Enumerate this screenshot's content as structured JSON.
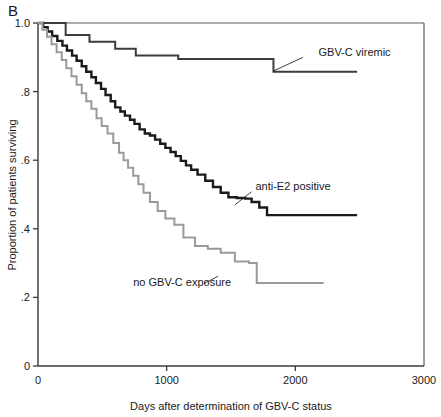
{
  "figure": {
    "panel_label": "B"
  },
  "chart_data": {
    "type": "line",
    "title": "",
    "subtitle": "",
    "xlabel": "Days after determination of GBV-C status",
    "ylabel": "Proportion of patients surviving",
    "xlim": [
      0,
      3000
    ],
    "ylim": [
      0,
      1.0
    ],
    "xticks": [
      0,
      1000,
      2000,
      3000
    ],
    "xticklabels": [
      "0",
      "1000",
      "2000",
      "3000"
    ],
    "yticks": [
      0,
      0.2,
      0.4,
      0.6,
      0.8,
      1.0
    ],
    "yticklabels": [
      "0",
      ".2",
      ".4",
      ".6",
      ".8",
      "1.0"
    ],
    "grid": false,
    "legend_position": "inline-annotations",
    "curve_style": "step-post (Kaplan-Meier)",
    "series": [
      {
        "name": "GBV-C viremic",
        "color": "#3d3d3d",
        "stroke_width": 2.0,
        "label_x": 2180,
        "label_y": 0.915,
        "leader": [
          [
            2060,
            0.9
          ],
          [
            1830,
            0.86
          ]
        ],
        "x": [
          0,
          215,
          215,
          400,
          400,
          600,
          600,
          760,
          760,
          1090,
          1090,
          1830,
          1830,
          2480
        ],
        "y": [
          1.0,
          1.0,
          0.965,
          0.965,
          0.945,
          0.945,
          0.925,
          0.925,
          0.905,
          0.905,
          0.895,
          0.895,
          0.858,
          0.858
        ]
      },
      {
        "name": "anti-E2 positive",
        "color": "#1a1a1a",
        "stroke_width": 2.4,
        "label_x": 1690,
        "label_y": 0.525,
        "leader": [
          [
            1660,
            0.508
          ],
          [
            1530,
            0.47
          ]
        ],
        "x": [
          0,
          40,
          40,
          75,
          75,
          110,
          110,
          150,
          150,
          190,
          190,
          225,
          225,
          265,
          265,
          300,
          300,
          340,
          340,
          375,
          375,
          415,
          415,
          450,
          450,
          490,
          490,
          525,
          525,
          565,
          565,
          600,
          600,
          640,
          640,
          675,
          675,
          715,
          715,
          750,
          750,
          790,
          790,
          830,
          830,
          870,
          870,
          910,
          910,
          950,
          950,
          990,
          990,
          1030,
          1030,
          1070,
          1070,
          1110,
          1110,
          1150,
          1150,
          1190,
          1190,
          1240,
          1240,
          1300,
          1300,
          1360,
          1360,
          1420,
          1420,
          1480,
          1480,
          1545,
          1545,
          1610,
          1610,
          1660,
          1660,
          1720,
          1720,
          1780,
          1780,
          2480
        ],
        "y": [
          1.0,
          1.0,
          0.988,
          0.988,
          0.975,
          0.975,
          0.962,
          0.962,
          0.948,
          0.948,
          0.934,
          0.934,
          0.92,
          0.92,
          0.905,
          0.905,
          0.89,
          0.89,
          0.874,
          0.874,
          0.858,
          0.858,
          0.842,
          0.842,
          0.825,
          0.825,
          0.808,
          0.808,
          0.79,
          0.79,
          0.772,
          0.772,
          0.754,
          0.754,
          0.742,
          0.742,
          0.73,
          0.73,
          0.718,
          0.718,
          0.706,
          0.706,
          0.69,
          0.69,
          0.678,
          0.678,
          0.672,
          0.672,
          0.66,
          0.66,
          0.648,
          0.648,
          0.636,
          0.636,
          0.624,
          0.624,
          0.612,
          0.612,
          0.598,
          0.598,
          0.585,
          0.585,
          0.572,
          0.572,
          0.558,
          0.558,
          0.54,
          0.54,
          0.522,
          0.522,
          0.505,
          0.505,
          0.492,
          0.492,
          0.49,
          0.49,
          0.488,
          0.488,
          0.478,
          0.478,
          0.462,
          0.462,
          0.44,
          0.44
        ]
      },
      {
        "name": "no GBV-C exposure",
        "color": "#9a9a9a",
        "stroke_width": 2.0,
        "label_x": 740,
        "label_y": 0.245,
        "leader": [
          [
            1290,
            0.24
          ],
          [
            1400,
            0.262
          ]
        ],
        "x": [
          0,
          35,
          35,
          70,
          70,
          105,
          105,
          145,
          145,
          185,
          185,
          220,
          220,
          260,
          260,
          300,
          300,
          340,
          340,
          375,
          375,
          415,
          415,
          455,
          455,
          495,
          495,
          540,
          540,
          585,
          585,
          630,
          630,
          665,
          665,
          700,
          700,
          740,
          740,
          780,
          780,
          820,
          820,
          870,
          870,
          930,
          930,
          990,
          990,
          1060,
          1060,
          1130,
          1130,
          1220,
          1220,
          1320,
          1320,
          1420,
          1420,
          1530,
          1530,
          1640,
          1640,
          1700,
          1700,
          2220
        ],
        "y": [
          1.0,
          1.0,
          0.98,
          0.98,
          0.96,
          0.96,
          0.938,
          0.938,
          0.915,
          0.915,
          0.892,
          0.892,
          0.868,
          0.868,
          0.845,
          0.845,
          0.82,
          0.82,
          0.795,
          0.795,
          0.772,
          0.772,
          0.75,
          0.75,
          0.722,
          0.722,
          0.7,
          0.7,
          0.678,
          0.678,
          0.65,
          0.65,
          0.622,
          0.622,
          0.6,
          0.6,
          0.578,
          0.578,
          0.555,
          0.555,
          0.53,
          0.53,
          0.505,
          0.505,
          0.478,
          0.478,
          0.452,
          0.452,
          0.43,
          0.43,
          0.412,
          0.412,
          0.375,
          0.375,
          0.35,
          0.35,
          0.342,
          0.342,
          0.33,
          0.33,
          0.305,
          0.305,
          0.3,
          0.3,
          0.242,
          0.242
        ]
      }
    ]
  }
}
